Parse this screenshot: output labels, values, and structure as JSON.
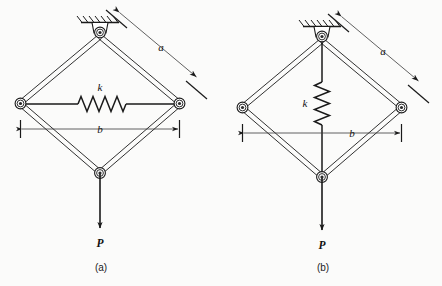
{
  "figure": {
    "background_color": "#fbfbfa",
    "ink_color": "#1a1a1a",
    "panels": [
      {
        "id": "a",
        "caption": "(a)",
        "description": "Rhombus four-bar linkage pinned at top to a hatched fixed ground support, horizontal spring connecting the left and right side pins, vertical load P applied at the bottom pin.",
        "labels": {
          "spring_stiffness": "k",
          "link_length": "a",
          "span": "b",
          "load": "P"
        },
        "spring": {
          "orientation": "horizontal",
          "coil_count": 7,
          "label": "k"
        },
        "dimension_a": {
          "label": "a",
          "orientation": "diagonal",
          "arrows": "both-ends"
        },
        "dimension_b": {
          "label": "b",
          "orientation": "horizontal",
          "arrows": "both-ends"
        },
        "load": {
          "label": "P",
          "direction": "down"
        },
        "support": {
          "type": "pinned-fixed",
          "hatching": true
        }
      },
      {
        "id": "b",
        "caption": "(b)",
        "description": "Rhombus four-bar linkage pinned at top to a hatched fixed ground support, vertical spring on the rod connecting the top pin to the bottom pin, vertical load P applied at the bottom pin.",
        "labels": {
          "spring_stiffness": "k",
          "link_length": "a",
          "span": "b",
          "load": "P"
        },
        "spring": {
          "orientation": "vertical",
          "coil_count": 7,
          "label": "k"
        },
        "dimension_a": {
          "label": "a",
          "orientation": "diagonal",
          "arrows": "both-ends"
        },
        "dimension_b": {
          "label": "b",
          "orientation": "horizontal",
          "arrows": "both-ends"
        },
        "load": {
          "label": "P",
          "direction": "down"
        },
        "support": {
          "type": "pinned-fixed",
          "hatching": true
        }
      }
    ]
  }
}
